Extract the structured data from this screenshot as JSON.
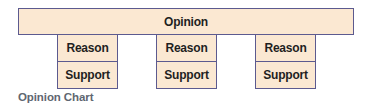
{
  "diagram": {
    "type": "opinion-chart",
    "opinion": {
      "label": "Opinion"
    },
    "columns": [
      {
        "reason": "Reason",
        "support": "Support"
      },
      {
        "reason": "Reason",
        "support": "Support"
      },
      {
        "reason": "Reason",
        "support": "Support"
      }
    ],
    "caption": "Opinion Chart"
  },
  "colors": {
    "box_fill": "#fbe8d2",
    "box_border": "#5c5a8f",
    "box_text": "#1f1f1f",
    "caption_text": "#5f6771"
  }
}
